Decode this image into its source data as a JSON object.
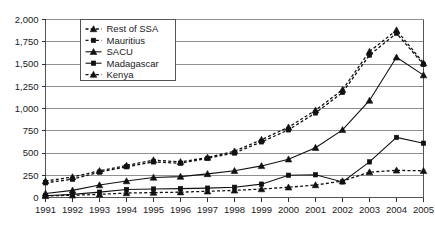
{
  "chart_data": {
    "type": "line",
    "title": "",
    "xlabel": "",
    "ylabel": "",
    "x": [
      1991,
      1992,
      1993,
      1994,
      1995,
      1996,
      1997,
      1998,
      1999,
      2000,
      2001,
      2002,
      2003,
      2004,
      2005
    ],
    "categories": [
      "1991",
      "1992",
      "1993",
      "1994",
      "1995",
      "1996",
      "1997",
      "1998",
      "1999",
      "2000",
      "2001",
      "2002",
      "2003",
      "2004",
      "2005"
    ],
    "ylim": [
      0,
      2000
    ],
    "yticks": [
      0,
      250,
      500,
      750,
      1000,
      1250,
      1500,
      1750,
      2000
    ],
    "ytick_labels": [
      "0",
      "250",
      "500",
      "750",
      "1,000",
      "1,250",
      "1,500",
      "1,750",
      "2,000"
    ],
    "grid": true,
    "legend_position": "top-left-inside",
    "series": [
      {
        "name": "Rest of SSA",
        "line_style": "dashed",
        "marker": "triangle",
        "values": [
          185,
          230,
          300,
          360,
          420,
          400,
          450,
          520,
          650,
          790,
          980,
          1210,
          1640,
          1880,
          1510
        ]
      },
      {
        "name": "Mauritius",
        "line_style": "dashed",
        "marker": "square",
        "values": [
          165,
          205,
          285,
          345,
          400,
          385,
          440,
          500,
          625,
          760,
          950,
          1180,
          1600,
          1845,
          1495
        ]
      },
      {
        "name": "SACU",
        "line_style": "solid",
        "marker": "triangle",
        "values": [
          45,
          80,
          140,
          185,
          225,
          235,
          265,
          300,
          355,
          430,
          560,
          760,
          1090,
          1575,
          1375
        ]
      },
      {
        "name": "Madagascar",
        "line_style": "solid",
        "marker": "square",
        "values": [
          20,
          35,
          60,
          90,
          95,
          100,
          105,
          115,
          150,
          250,
          255,
          175,
          400,
          675,
          610
        ]
      },
      {
        "name": "Kenya",
        "line_style": "dashed",
        "marker": "triangle",
        "values": [
          18,
          25,
          35,
          50,
          55,
          60,
          70,
          80,
          95,
          115,
          140,
          185,
          285,
          305,
          300
        ]
      }
    ]
  },
  "legend": {
    "entries": [
      {
        "label": "Rest of SSA"
      },
      {
        "label": "Mauritius"
      },
      {
        "label": "SACU"
      },
      {
        "label": "Madagascar"
      },
      {
        "label": "Kenya"
      }
    ]
  }
}
